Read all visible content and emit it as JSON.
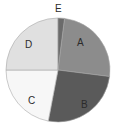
{
  "chart_data": {
    "type": "pie",
    "title": "",
    "subtitle": "",
    "xlabel": "",
    "ylabel": "",
    "legend_position": "none",
    "grid": false,
    "labels_inside": true,
    "start_angle_deg": 90,
    "direction": "clockwise",
    "categories": [
      "A",
      "B",
      "C",
      "D",
      "E"
    ],
    "values": [
      25,
      26,
      22,
      25,
      2
    ],
    "percentages": [
      25,
      26,
      22,
      25,
      2
    ],
    "colors": [
      "#8c8c8c",
      "#5a5a5a",
      "#f7f7f7",
      "#e0e0e0",
      "#6b6b6b"
    ],
    "angles_deg": [
      90,
      93.6,
      79.2,
      90,
      7.2
    ],
    "edge_color": "#a8a8a8",
    "edge_width": 0.6,
    "background": "#ffffff",
    "slices": [
      {
        "label": "A",
        "value": 25,
        "percent": 25,
        "color": "#8c8c8c",
        "start_deg": 7.2,
        "end_deg": 97.2
      },
      {
        "label": "B",
        "value": 26,
        "percent": 26,
        "color": "#5a5a5a",
        "start_deg": 97.2,
        "end_deg": 190.8
      },
      {
        "label": "C",
        "value": 22,
        "percent": 22,
        "color": "#f7f7f7",
        "start_deg": 190.8,
        "end_deg": 270.0
      },
      {
        "label": "D",
        "value": 25,
        "percent": 25,
        "color": "#e0e0e0",
        "start_deg": 270.0,
        "end_deg": 360.0
      },
      {
        "label": "E",
        "value": 2,
        "percent": 2,
        "color": "#6b6b6b",
        "start_deg": 0.0,
        "end_deg": 7.2
      }
    ]
  },
  "figure": {
    "center_x": 58,
    "center_y": 70,
    "radius": 52
  },
  "labels": {
    "a": "A",
    "b": "B",
    "c": "C",
    "d": "D",
    "e": "E"
  }
}
